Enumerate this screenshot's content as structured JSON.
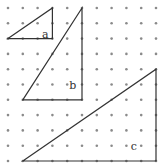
{
  "diagram": {
    "type": "dot-grid-triangles",
    "grid": {
      "columns": 11,
      "rows": 11,
      "dot_color": "#8a8a8a",
      "line_color": "#333333"
    },
    "triangles": [
      {
        "label": "a",
        "vertices": [
          [
            0,
            2
          ],
          [
            3,
            0
          ],
          [
            3,
            2
          ]
        ],
        "right_angle": [
          3,
          2
        ]
      },
      {
        "label": "b",
        "vertices": [
          [
            1,
            6
          ],
          [
            5,
            0
          ],
          [
            5,
            6
          ]
        ],
        "right_angle": [
          5,
          6
        ]
      },
      {
        "label": "c",
        "vertices": [
          [
            1,
            10
          ],
          [
            10,
            4
          ],
          [
            10,
            10
          ]
        ],
        "right_angle": [
          10,
          10
        ]
      }
    ]
  }
}
